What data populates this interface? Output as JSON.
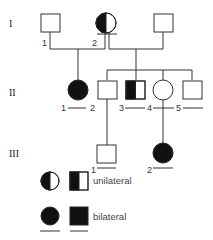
{
  "diagram": {
    "type": "pedigree",
    "generations": [
      {
        "label": "I",
        "members": [
          {
            "id": "I-1",
            "number": "1",
            "sex": "male",
            "status": "unaffected"
          },
          {
            "id": "I-2",
            "number": "2",
            "sex": "female",
            "status": "unilateral"
          },
          {
            "id": "I-3",
            "number": "",
            "sex": "male",
            "status": "unaffected"
          }
        ]
      },
      {
        "label": "II",
        "members": [
          {
            "id": "II-1",
            "number": "1",
            "sex": "female",
            "status": "bilateral"
          },
          {
            "id": "II-2",
            "number": "2",
            "sex": "male",
            "status": "unaffected"
          },
          {
            "id": "II-3",
            "number": "3",
            "sex": "male",
            "status": "unilateral"
          },
          {
            "id": "II-4",
            "number": "4",
            "sex": "female",
            "status": "unaffected"
          },
          {
            "id": "II-5",
            "number": "5",
            "sex": "male",
            "status": "unaffected"
          }
        ]
      },
      {
        "label": "III",
        "members": [
          {
            "id": "III-1",
            "number": "1",
            "sex": "male",
            "status": "unaffected"
          },
          {
            "id": "III-2",
            "number": "2",
            "sex": "female",
            "status": "bilateral"
          }
        ]
      }
    ],
    "legend": {
      "unilateral": "unilateral",
      "bilateral": "bilateral"
    },
    "colors": {
      "line": "#333333",
      "affected": "#111111",
      "background": "#ffffff"
    }
  }
}
